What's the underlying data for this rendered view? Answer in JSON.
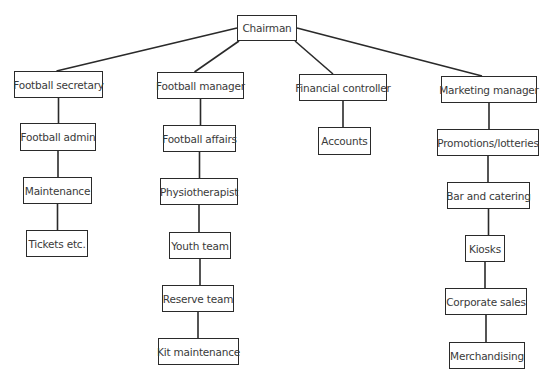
{
  "diagram": {
    "type": "org-chart",
    "root": {
      "id": "chairman",
      "label": "Chairman",
      "box": [
        237,
        15,
        60,
        26
      ]
    },
    "departments": [
      {
        "id": "football-secretary",
        "label": "Football secretary",
        "box": [
          14,
          71,
          89,
          27
        ],
        "children": [
          {
            "id": "football-admin",
            "label": "Football admin",
            "box": [
              20,
              123,
              76,
              28
            ]
          },
          {
            "id": "maintenance",
            "label": "Maintenance",
            "box": [
              23,
              177,
              69,
              27
            ]
          },
          {
            "id": "tickets",
            "label": "Tickets etc.",
            "box": [
              26,
              230,
              62,
              27
            ]
          }
        ]
      },
      {
        "id": "football-manager",
        "label": "Football manager",
        "box": [
          157,
          72,
          87,
          27
        ],
        "children": [
          {
            "id": "football-affairs",
            "label": "Football affairs",
            "box": [
              163,
              125,
              73,
              27
            ]
          },
          {
            "id": "physiotherapist",
            "label": "Physiotherapist",
            "box": [
              160,
              178,
              78,
              27
            ]
          },
          {
            "id": "youth-team",
            "label": "Youth team",
            "box": [
              169,
              232,
              62,
              27
            ]
          },
          {
            "id": "reserve-team",
            "label": "Reserve team",
            "box": [
              162,
              285,
              72,
              27
            ]
          },
          {
            "id": "kit-maintenance",
            "label": "Kit maintenance",
            "box": [
              158,
              338,
              81,
              27
            ]
          }
        ]
      },
      {
        "id": "financial-controller",
        "label": "Financial controller",
        "box": [
          299,
          74,
          88,
          27
        ],
        "children": [
          {
            "id": "accounts",
            "label": "Accounts",
            "box": [
              318,
              127,
              53,
              28
            ]
          }
        ]
      },
      {
        "id": "marketing-manager",
        "label": "Marketing manager",
        "box": [
          441,
          76,
          96,
          27
        ],
        "children": [
          {
            "id": "promotions-lotteries",
            "label": "Promotions/lotteries",
            "box": [
              437,
              129,
              102,
              27
            ]
          },
          {
            "id": "bar-and-catering",
            "label": "Bar and catering",
            "box": [
              447,
              182,
              83,
              27
            ]
          },
          {
            "id": "kiosks",
            "label": "Kiosks",
            "box": [
              465,
              235,
              40,
              27
            ]
          },
          {
            "id": "corporate-sales",
            "label": "Corporate sales",
            "box": [
              445,
              288,
              82,
              27
            ]
          },
          {
            "id": "merchandising",
            "label": "Merchandising",
            "box": [
              449,
              342,
              76,
              27
            ]
          }
        ]
      }
    ]
  },
  "colors": {
    "line": "#2a2a2a",
    "text": "#3a3a3a",
    "background": "#ffffff"
  }
}
